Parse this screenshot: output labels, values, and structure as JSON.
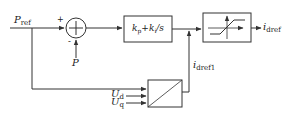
{
  "diagram": {
    "type": "control-block-diagram",
    "inputs": {
      "p_ref": {
        "main": "P",
        "sub": "ref"
      },
      "p_feedback": {
        "main": "P"
      },
      "u_d": {
        "main": "U",
        "sub": "d"
      },
      "u_q": {
        "main": "U",
        "sub": "q"
      }
    },
    "summing_junction": {
      "plus_sign": "+",
      "minus_sign": "-"
    },
    "pi_block": {
      "kp": {
        "main": "k",
        "sub": "p"
      },
      "plus": "+",
      "ki": {
        "main": "k",
        "sub": "i"
      },
      "div_s": "/s"
    },
    "limiter_block": {
      "icon": "saturation-icon"
    },
    "divider_block": {
      "icon": "diagonal-divider-icon"
    },
    "outputs": {
      "i_dref": {
        "main": "i",
        "sub": "dref"
      },
      "i_dref1": {
        "main": "i",
        "sub": "dref1"
      }
    },
    "colors": {
      "line": "#333333",
      "background": "#ffffff"
    }
  }
}
